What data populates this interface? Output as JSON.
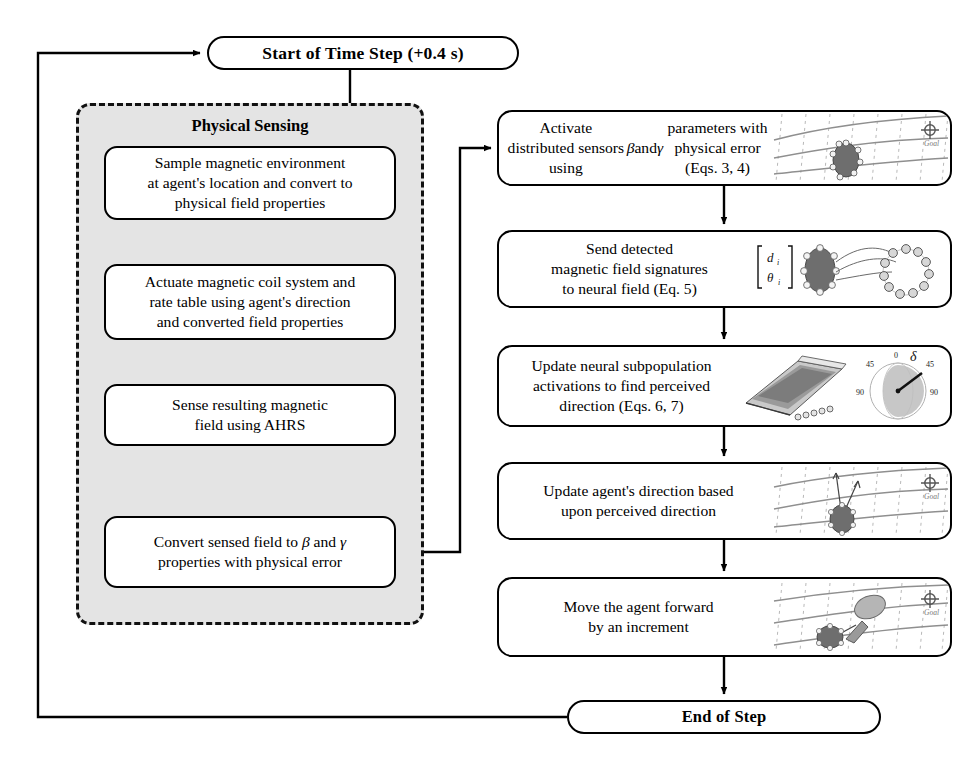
{
  "diagram": {
    "title_node_start": "Start of Time Step (+0.4 s)",
    "title_node_end": "End of Step",
    "group": {
      "label": "Physical Sensing",
      "steps": [
        "Sample magnetic environment\nat agent's location and convert to\nphysical field properties",
        "Actuate magnetic coil system and\nrate table using agent's direction\nand converted field properties",
        "Sense resulting magnetic\nfield using AHRS",
        "Convert sensed field to β and γ\nproperties with physical error"
      ]
    },
    "right_steps": [
      {
        "text": "Activate distributed sensors\nusing β and γ parameters with\nphysical error (Eqs. 3, 4)",
        "figure": "field-grid-agent-goal",
        "figure_labels": {
          "goal": "Goal"
        }
      },
      {
        "text": "Send detected\nmagnetic field signatures\nto neural field (Eq. 5)",
        "figure": "agent-sensors-to-neural-ring",
        "figure_labels": {
          "vector_top": "d",
          "vector_bottom": "θ",
          "subscript": "i"
        }
      },
      {
        "text": "Update neural subpopulation\nactivations to find perceived\ndirection (Eqs. 6, 7)",
        "figure": "neural-surface-and-polar-plot",
        "figure_labels": {
          "delta": "δ",
          "ticks": [
            "0",
            "45",
            "45",
            "90",
            "90"
          ]
        }
      },
      {
        "text": "Update agent's direction based\nupon perceived direction",
        "figure": "agent-direction-vectors-goal",
        "figure_labels": {
          "goal": "Goal"
        }
      },
      {
        "text": "Move the agent forward\nby an increment",
        "figure": "agent-move-forward-goal",
        "figure_labels": {
          "goal": "Goal"
        }
      }
    ],
    "colors": {
      "stroke": "#000000",
      "panel_fill": "#e4e4e4",
      "agent_fill": "#6e6e6e",
      "field_line": "#8d8d8d",
      "grid_line": "#b4b4b4"
    }
  }
}
